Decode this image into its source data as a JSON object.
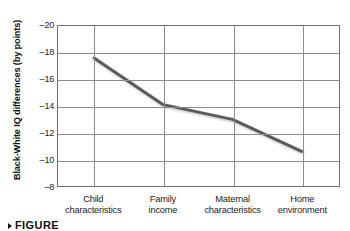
{
  "chart_data": {
    "type": "line",
    "title": "",
    "xlabel": "",
    "ylabel": "Black-White IQ differences (by points)",
    "categories": [
      "Child characteristics",
      "Family income",
      "Maternal characteristics",
      "Home environment"
    ],
    "category_lines": [
      [
        "Child",
        "characteristics"
      ],
      [
        "Family",
        "income"
      ],
      [
        "Maternal",
        "characteristics"
      ],
      [
        "Home",
        "environment"
      ]
    ],
    "values": [
      -17.6,
      -14.1,
      -13.0,
      -10.6
    ],
    "ylim": [
      -20,
      -8
    ],
    "y_ticks": [
      -20,
      -18,
      -16,
      -14,
      -12,
      -10,
      -8
    ],
    "y_tick_labels": [
      "–20",
      "–18",
      "–16",
      "–14",
      "–12",
      "–10",
      "–8"
    ],
    "y_axis_inverted": true,
    "grid": "both",
    "legend": "none",
    "series": [
      {
        "name": "Black-White IQ difference",
        "values": [
          -17.6,
          -14.1,
          -13.0,
          -10.6
        ],
        "color": "#5a5a5a",
        "line_width": 3
      }
    ]
  },
  "caption": {
    "label": "FIGURE",
    "bullet_icon": "triangle-right-icon"
  },
  "colors": {
    "line": "#5a5a5a",
    "grid": "#8d8d8d",
    "frame": "#6f6f6f",
    "text": "#1d1d1d",
    "background": "#ffffff"
  }
}
